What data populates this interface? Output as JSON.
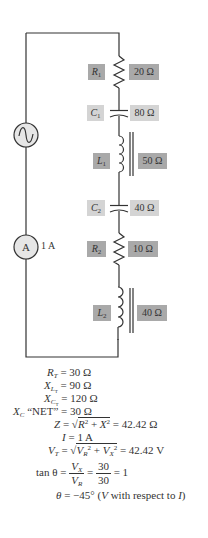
{
  "circuit": {
    "source_icon": "ac-source-icon",
    "ammeter": {
      "symbol": "A",
      "reading": "1 A"
    },
    "components": [
      {
        "id": "R1",
        "letter": "R",
        "sub": "1",
        "value": "20 Ω",
        "kind": "resistor"
      },
      {
        "id": "C1",
        "letter": "C",
        "sub": "1",
        "value": "80 Ω",
        "kind": "capacitor"
      },
      {
        "id": "L1",
        "letter": "L",
        "sub": "1",
        "value": "50 Ω",
        "kind": "inductor"
      },
      {
        "id": "C2",
        "letter": "C",
        "sub": "2",
        "value": "40 Ω",
        "kind": "capacitor"
      },
      {
        "id": "R2",
        "letter": "R",
        "sub": "2",
        "value": "10 Ω",
        "kind": "resistor"
      },
      {
        "id": "L2",
        "letter": "L",
        "sub": "2",
        "value": "40 Ω",
        "kind": "inductor"
      }
    ],
    "colors": {
      "resistor_box": "#a9a9a9",
      "capacitor_box": "#d4d4d4",
      "inductor_box": "#a9a9a9",
      "wire": "#333333"
    }
  },
  "equations": {
    "rt": {
      "lhs": "R",
      "lhs_sub": "T",
      "rhs": "= 30 Ω"
    },
    "xlt": {
      "lhs": "X",
      "lhs_sub": "L",
      "lhs_subsub": "T",
      "rhs": "= 90 Ω"
    },
    "xct": {
      "lhs": "X",
      "lhs_sub": "C",
      "lhs_subsub": "T",
      "rhs": "= 120 Ω"
    },
    "xcnet": {
      "lhs": "X",
      "lhs_sub": "C",
      "quote": "“NET”",
      "rhs": "= 30 Ω"
    },
    "z": {
      "lhs": "Z",
      "eq": "=",
      "sqrt_body_R": "R",
      "sqrt_plus": " + ",
      "sqrt_body_X": "X",
      "sup": "2",
      "rhs": "= 42.42 Ω"
    },
    "i": {
      "lhs": "I",
      "rhs": "= 1 A"
    },
    "vt": {
      "lhs": "V",
      "lhs_sub": "T",
      "eq": "=",
      "vr": "V",
      "vr_sub": "R",
      "plus": " + ",
      "vx": "V",
      "vx_sub": "X",
      "sup": "2",
      "rhs": "= 42.42 V"
    },
    "tan": {
      "lhs": "tan θ =",
      "num1": "V",
      "num1_sub": "X",
      "den1": "V",
      "den1_sub": "R",
      "eq": "=",
      "num2": "30",
      "den2": "30",
      "rhs": "= 1"
    },
    "theta": {
      "lhs": "θ",
      "rhs": "= −45° (",
      "v": "V",
      "mid": " with respect to ",
      "i": "I",
      "close": ")"
    }
  }
}
